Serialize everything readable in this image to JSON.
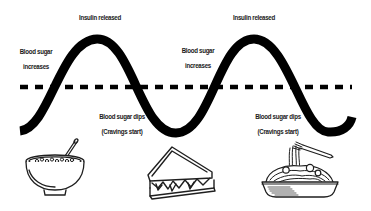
{
  "diagram": {
    "type": "blood-sugar-cycle",
    "colors": {
      "curve": "#000000",
      "baseline": "#000000",
      "text": "#1a1a1a",
      "background": "#ffffff",
      "icon_stroke": "#1f1f1f"
    },
    "peak_labels": [
      {
        "text": "Insulin released"
      },
      {
        "text": "Insulin released"
      }
    ],
    "rise_labels": [
      {
        "line1": "Blood sugar",
        "line2": "increases"
      },
      {
        "line1": "Blood sugar",
        "line2": "increases"
      }
    ],
    "dip_labels": [
      {
        "line1": "Blood sugar dips",
        "line2": "(Cravings start)"
      },
      {
        "line1": "Blood sugar dips",
        "line2": "(Cravings start)"
      }
    ],
    "foods": [
      {
        "name": "cereal-bowl-icon"
      },
      {
        "name": "sandwich-icon"
      },
      {
        "name": "spaghetti-plate-icon"
      }
    ],
    "curve_points": [
      {
        "x": 20,
        "y": 130,
        "role": "start"
      },
      {
        "x": 97,
        "y": 39,
        "role": "peak"
      },
      {
        "x": 176,
        "y": 133,
        "role": "trough"
      },
      {
        "x": 254,
        "y": 39,
        "role": "peak"
      },
      {
        "x": 330,
        "y": 133,
        "role": "trough"
      },
      {
        "x": 352,
        "y": 118,
        "role": "end"
      }
    ],
    "baseline_y": 87
  }
}
